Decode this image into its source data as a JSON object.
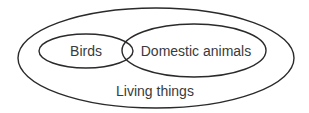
{
  "diagram": {
    "type": "venn",
    "sets": [
      {
        "id": "living_things",
        "label": "Living things"
      },
      {
        "id": "birds",
        "label": "Birds"
      },
      {
        "id": "domestic_animals",
        "label": "Domestic animals"
      }
    ],
    "relations": [
      {
        "subset": "birds",
        "of": "living_things"
      },
      {
        "subset": "domestic_animals",
        "of": "living_things"
      },
      {
        "overlap": [
          "birds",
          "domestic_animals"
        ]
      }
    ],
    "stroke_color": "#2a2a2a",
    "text_color": "#3a3a3a"
  }
}
